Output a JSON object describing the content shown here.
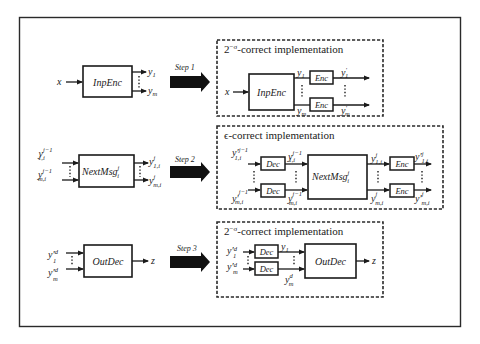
{
  "figure": {
    "rows": [
      {
        "original": {
          "input": "x",
          "block": "InpEnc",
          "outputs": [
            {
              "base": "y",
              "sub": "1",
              "sup": ""
            },
            {
              "base": "y",
              "sub": "m",
              "sup": ""
            }
          ]
        },
        "step_label": "Step 1",
        "implementation": {
          "title_prefix": "2",
          "title_exp": "−σ",
          "title_suffix": "-correct implementation",
          "input": "x",
          "block": "InpEnc",
          "mid_labels": [
            {
              "base": "y",
              "sub": "1",
              "sup": ""
            },
            {
              "base": "y",
              "sub": "m",
              "sup": ""
            }
          ],
          "sub_block": "Enc",
          "outputs": [
            {
              "base": "y",
              "sub": "1",
              "sup": "′"
            },
            {
              "base": "y",
              "sub": "m",
              "sup": "′"
            }
          ]
        }
      },
      {
        "original": {
          "inputs": [
            {
              "base": "y",
              "sub": "1,i",
              "sup": "j−1"
            },
            {
              "base": "y",
              "sub": "m,i",
              "sup": "j−1"
            }
          ],
          "block": "NextMsg",
          "block_sub": "i",
          "block_sup": "j",
          "outputs": [
            {
              "base": "y",
              "sub": "1,i",
              "sup": "j"
            },
            {
              "base": "y",
              "sub": "m,i",
              "sup": "j"
            }
          ]
        },
        "step_label": "Step 2",
        "implementation": {
          "title_prefix": "ϵ",
          "title_exp": "",
          "title_suffix": "-correct implementation",
          "inputs": [
            {
              "base": "y′",
              "sub": "1,i",
              "sup": "j−1"
            },
            {
              "base": "y′",
              "sub": "m,i",
              "sup": "j−1"
            }
          ],
          "pre_block": "Dec",
          "mid_in_labels": [
            {
              "base": "y",
              "sub": "1,i",
              "sup": "j−1"
            },
            {
              "base": "y",
              "sub": "m,i",
              "sup": "j−1"
            }
          ],
          "block": "NextMsg",
          "block_sub": "i",
          "block_sup": "j",
          "mid_out_labels": [
            {
              "base": "y",
              "sub": "1,i",
              "sup": "j"
            },
            {
              "base": "y",
              "sub": "m,i",
              "sup": "j"
            }
          ],
          "post_block": "Enc",
          "outputs": [
            {
              "base": "y′",
              "sub": "1,i",
              "sup": "j"
            },
            {
              "base": "y′",
              "sub": "m,i",
              "sup": "j"
            }
          ]
        }
      },
      {
        "original": {
          "inputs": [
            {
              "base": "y′",
              "sub": "1",
              "sup": "d"
            },
            {
              "base": "y′",
              "sub": "m",
              "sup": "d"
            }
          ],
          "block": "OutDec",
          "output": "z"
        },
        "step_label": "Step 3",
        "implementation": {
          "title_prefix": "2",
          "title_exp": "−σ",
          "title_suffix": "-correct implementation",
          "inputs": [
            {
              "base": "y′",
              "sub": "1",
              "sup": "d"
            },
            {
              "base": "y′",
              "sub": "m",
              "sup": "d"
            }
          ],
          "pre_block": "Dec",
          "mid_labels": [
            {
              "base": "y",
              "sub": "1",
              "sup": ""
            },
            {
              "base": "y",
              "sub": "m",
              "sup": "d"
            }
          ],
          "block": "OutDec",
          "output": "z"
        }
      }
    ]
  },
  "colors": {
    "stroke": "#1a1a1a",
    "background": "#ffffff",
    "arrow_fill": "#111111"
  }
}
